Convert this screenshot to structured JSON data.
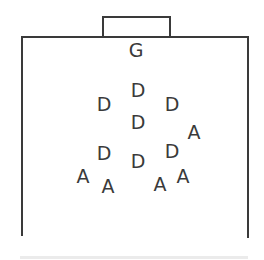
{
  "diagram": {
    "type": "field-formation",
    "stroke_color": "#3a3a3a",
    "goal": {
      "label": ""
    },
    "goalkeeper": {
      "label": "G",
      "x": 136,
      "y": 50
    },
    "defenders": [
      {
        "label": "D",
        "x": 104,
        "y": 104
      },
      {
        "label": "D",
        "x": 138,
        "y": 90
      },
      {
        "label": "D",
        "x": 172,
        "y": 104
      },
      {
        "label": "D",
        "x": 138,
        "y": 122
      },
      {
        "label": "D",
        "x": 104,
        "y": 153
      },
      {
        "label": "D",
        "x": 138,
        "y": 161
      },
      {
        "label": "D",
        "x": 172,
        "y": 151
      }
    ],
    "attackers": [
      {
        "label": "A",
        "x": 194,
        "y": 132
      },
      {
        "label": "A",
        "x": 83,
        "y": 176
      },
      {
        "label": "A",
        "x": 108,
        "y": 186
      },
      {
        "label": "A",
        "x": 160,
        "y": 184
      },
      {
        "label": "A",
        "x": 183,
        "y": 176
      }
    ]
  }
}
